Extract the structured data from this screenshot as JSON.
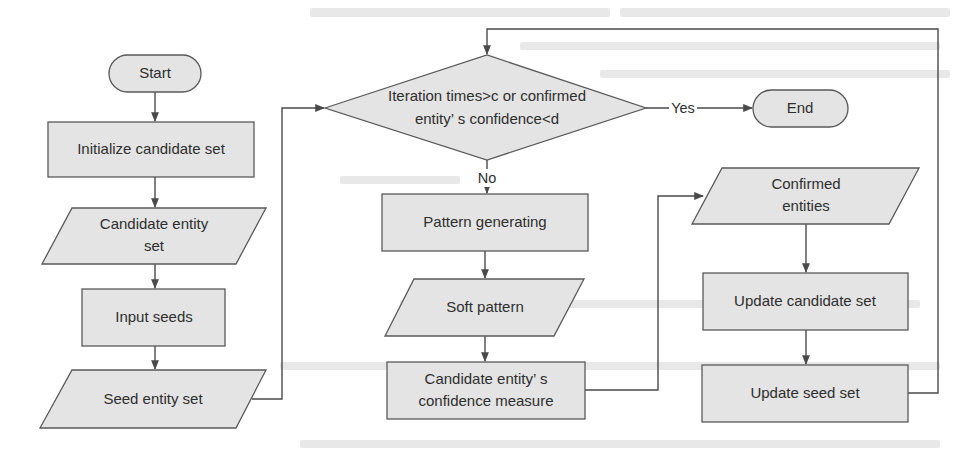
{
  "diagram": {
    "type": "flowchart",
    "nodes": {
      "start": {
        "label": "Start",
        "shape": "terminal"
      },
      "init_candidate": {
        "label": "Initialize candidate set",
        "shape": "process"
      },
      "candidate_entity_set": {
        "label_lines": [
          "Candidate entity",
          "set"
        ],
        "shape": "data"
      },
      "input_seeds": {
        "label": "Input seeds",
        "shape": "process"
      },
      "seed_entity_set": {
        "label": "Seed entity set",
        "shape": "data"
      },
      "decision": {
        "label_lines": [
          "Iteration times>c or confirmed",
          "entity’ s confidence<d"
        ],
        "shape": "decision"
      },
      "end": {
        "label": "End",
        "shape": "terminal"
      },
      "pattern_generating": {
        "label": "Pattern generating",
        "shape": "process"
      },
      "soft_pattern": {
        "label": "Soft pattern",
        "shape": "data"
      },
      "confidence_measure": {
        "label_lines": [
          "Candidate entity’ s",
          "confidence measure"
        ],
        "shape": "process"
      },
      "confirmed_entities": {
        "label_lines": [
          "Confirmed",
          "entities"
        ],
        "shape": "data"
      },
      "update_candidate": {
        "label": "Update candidate set",
        "shape": "process"
      },
      "update_seed": {
        "label": "Update seed set",
        "shape": "process"
      }
    },
    "edges": [
      {
        "from": "start",
        "to": "init_candidate",
        "label": ""
      },
      {
        "from": "init_candidate",
        "to": "candidate_entity_set",
        "label": ""
      },
      {
        "from": "candidate_entity_set",
        "to": "input_seeds",
        "label": ""
      },
      {
        "from": "input_seeds",
        "to": "seed_entity_set",
        "label": ""
      },
      {
        "from": "seed_entity_set",
        "to": "decision",
        "label": ""
      },
      {
        "from": "decision",
        "to": "end",
        "label": "Yes"
      },
      {
        "from": "decision",
        "to": "pattern_generating",
        "label": "No"
      },
      {
        "from": "pattern_generating",
        "to": "soft_pattern",
        "label": ""
      },
      {
        "from": "soft_pattern",
        "to": "confidence_measure",
        "label": ""
      },
      {
        "from": "confidence_measure",
        "to": "confirmed_entities",
        "label": ""
      },
      {
        "from": "confirmed_entities",
        "to": "update_candidate",
        "label": ""
      },
      {
        "from": "update_candidate",
        "to": "update_seed",
        "label": ""
      },
      {
        "from": "update_seed",
        "to": "decision",
        "label": ""
      }
    ],
    "edge_labels": {
      "yes": "Yes",
      "no": "No"
    }
  },
  "colors": {
    "shape_fill": "#e4e4e4",
    "shape_stroke": "#595959",
    "connector": "#4a4a4a",
    "text": "#2e2e2e",
    "background": "#ffffff"
  }
}
